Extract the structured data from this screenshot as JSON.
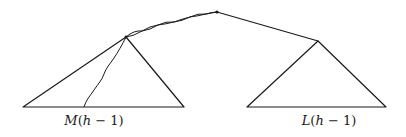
{
  "diagram": {
    "type": "tree",
    "colors": {
      "stroke": "#1a1a1a",
      "background": "#ffffff"
    },
    "nodes": {
      "root": {
        "x": 217,
        "y": 12
      },
      "left_apex": {
        "x": 126,
        "y": 37
      },
      "right_apex": {
        "x": 318,
        "y": 41
      }
    },
    "subtrees": [
      {
        "id": "left",
        "label_func": "M",
        "label_arg": "h",
        "label_op": " − ",
        "label_const": "1",
        "label": "M(h − 1)",
        "apex": [
          126,
          37
        ],
        "base_left": [
          23,
          107
        ],
        "base_right": [
          184,
          107
        ]
      },
      {
        "id": "right",
        "label_func": "L",
        "label_arg": "h",
        "label_op": " − ",
        "label_const": "1",
        "label": "L(h − 1)",
        "apex": [
          318,
          41
        ],
        "base_left": [
          247,
          107
        ],
        "base_right": [
          386,
          107
        ]
      }
    ],
    "edges": [
      {
        "from": "root",
        "to": "left_apex",
        "style": "wavy"
      },
      {
        "from": "root",
        "to": "right_apex",
        "style": "straight"
      },
      {
        "from": "left_apex",
        "to": "left_base_point",
        "style": "wavy",
        "end": [
          84,
          107
        ]
      }
    ]
  }
}
